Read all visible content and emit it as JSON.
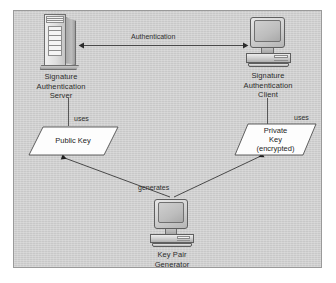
{
  "diagram": {
    "background_color": "#cdcdcd",
    "border_color": "#9a9a9a",
    "nodes": [
      {
        "id": "signature-authentication-server",
        "icon": "server-tower-icon",
        "label": "Signature\nAuthentication\nServer"
      },
      {
        "id": "signature-authentication-client",
        "icon": "desktop-computer-icon",
        "label": "Signature\nAuthentication\nClient"
      },
      {
        "id": "key-pair-generator",
        "icon": "desktop-computer-icon",
        "label": "Key Pair\nGenerator"
      }
    ],
    "data_shapes": [
      {
        "id": "public-key",
        "shape": "parallelogram",
        "label": "Public Key"
      },
      {
        "id": "private-key",
        "shape": "parallelogram",
        "label": "Private\nKey\n(encrypted)"
      }
    ],
    "edges": [
      {
        "id": "authentication-edge",
        "label": "Authentication",
        "from": "signature-authentication-client",
        "to": "signature-authentication-server",
        "arrow": "both"
      },
      {
        "id": "server-uses-public-key-edge",
        "label": "uses",
        "from": "signature-authentication-server",
        "to": "public-key",
        "arrow": "none"
      },
      {
        "id": "client-uses-private-key-edge",
        "label": "uses",
        "from": "signature-authentication-client",
        "to": "private-key",
        "arrow": "none"
      },
      {
        "id": "generates-public-key-edge",
        "label": "generates",
        "from": "key-pair-generator",
        "to": "public-key",
        "arrow": "to"
      },
      {
        "id": "generates-private-key-edge",
        "label": "",
        "from": "key-pair-generator",
        "to": "private-key",
        "arrow": "to"
      }
    ]
  }
}
